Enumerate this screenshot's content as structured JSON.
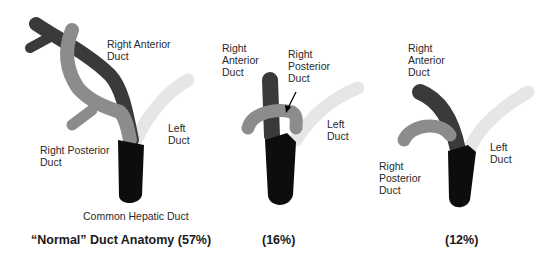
{
  "colors": {
    "right_anterior": "#3a3a3a",
    "right_posterior": "#8c8c8c",
    "left": "#e6e6e6",
    "common_hepatic": "#0d0d0d"
  },
  "panels": [
    {
      "labels": {
        "right_anterior": "Right Anterior\nDuct",
        "right_posterior": "Right Posterior\nDuct",
        "left": "Left\nDuct",
        "common_hepatic": "Common Hepatic Duct"
      },
      "caption": "“Normal” Duct Anatomy (57%)"
    },
    {
      "labels": {
        "right_anterior": "Right\nAnterior\nDuct",
        "right_posterior": "Right\nPosterior\nDuct",
        "left": "Left\nDuct"
      },
      "caption": "(16%)"
    },
    {
      "labels": {
        "right_anterior": "Right\nAnterior\nDuct",
        "right_posterior": "Right\nPosterior\nDuct",
        "left": "Left\nDuct"
      },
      "caption": "(12%)"
    }
  ]
}
